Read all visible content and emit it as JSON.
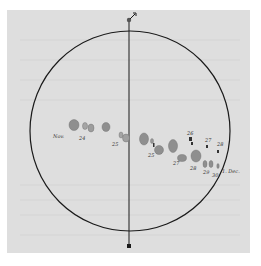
{
  "figure": {
    "colors": {
      "paper": "#dedede",
      "ink": "#1a1a1a",
      "spot": "#8f8f8f"
    },
    "axis_marks": {
      "top": "N",
      "bottom": ""
    },
    "labels": {
      "left_end": "Nov.",
      "right_end": "1. Dec.",
      "dates": [
        "24",
        "25",
        "25",
        "26",
        "26",
        "27",
        "27",
        "28",
        "28",
        "29",
        "30"
      ]
    }
  }
}
